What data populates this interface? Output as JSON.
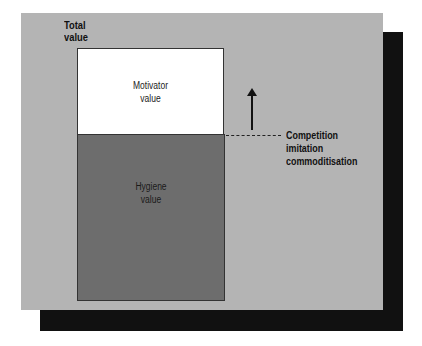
{
  "diagram": {
    "axis_label": "Total value",
    "axis_label_lines": [
      "Total",
      "value"
    ],
    "boxes": [
      {
        "name": "motivator",
        "label_lines": [
          "Motivator",
          "value"
        ],
        "color": "#ffffff"
      },
      {
        "name": "hygiene",
        "label_lines": [
          "Hygiene",
          "value"
        ],
        "color": "#6d6d6d"
      }
    ],
    "annotation": {
      "lines": [
        "Competition",
        "imitation",
        "commoditisation"
      ]
    },
    "colors": {
      "panel": "#b4b4b4",
      "shadow": "#111111"
    }
  }
}
